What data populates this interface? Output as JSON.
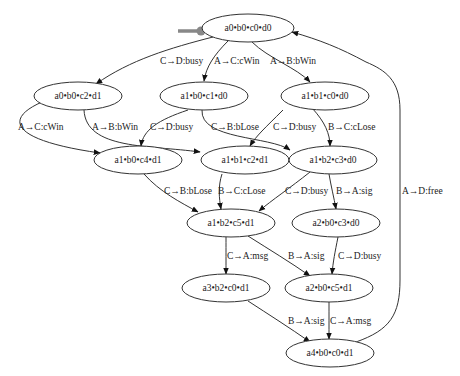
{
  "diagram": {
    "type": "state-transition-graph",
    "start_marker": {
      "color": "#888888",
      "points_to": "s0"
    },
    "nodes": [
      {
        "id": "s0",
        "label": "a0•b0•c0•d0",
        "cx": 248,
        "cy": 28
      },
      {
        "id": "s1",
        "label": "a0•b0•c2•d1",
        "cx": 78,
        "cy": 96
      },
      {
        "id": "s2",
        "label": "a1•b0•c1•d0",
        "cx": 204,
        "cy": 96
      },
      {
        "id": "s3",
        "label": "a1•b1•c0•d0",
        "cx": 325,
        "cy": 96
      },
      {
        "id": "s4",
        "label": "a1•b0•c4•d1",
        "cx": 138,
        "cy": 160
      },
      {
        "id": "s5",
        "label": "a1•b1•c2•d1",
        "cx": 245,
        "cy": 160
      },
      {
        "id": "s6",
        "label": "a1•b2•c3•d0",
        "cx": 333,
        "cy": 160
      },
      {
        "id": "s7",
        "label": "a1•b2•c5•d1",
        "cx": 231,
        "cy": 223
      },
      {
        "id": "s8",
        "label": "a2•b0•c3•d0",
        "cx": 336,
        "cy": 223
      },
      {
        "id": "s9",
        "label": "a3•b2•c0•d1",
        "cx": 226,
        "cy": 288
      },
      {
        "id": "s10",
        "label": "a2•b0•c5•d1",
        "cx": 329,
        "cy": 288
      },
      {
        "id": "s11",
        "label": "a4•b0•c0•d1",
        "cx": 330,
        "cy": 353
      }
    ],
    "edges": [
      {
        "from": "s0",
        "to": "s1",
        "label": "C→D:busy"
      },
      {
        "from": "s0",
        "to": "s2",
        "label": "A→C:cWin"
      },
      {
        "from": "s0",
        "to": "s3",
        "label": "A→B:bWin"
      },
      {
        "from": "s1",
        "to": "s4",
        "label": "A→C:cWin"
      },
      {
        "from": "s1",
        "to": "s5",
        "label": "A→B:bWin"
      },
      {
        "from": "s2",
        "to": "s4",
        "label": "C→D:busy"
      },
      {
        "from": "s2",
        "to": "s6",
        "label": "C→B:bLose"
      },
      {
        "from": "s3",
        "to": "s5",
        "label": "C→D:busy"
      },
      {
        "from": "s3",
        "to": "s6",
        "label": "B→C:cLose"
      },
      {
        "from": "s4",
        "to": "s7",
        "label": "C→B:bLose"
      },
      {
        "from": "s5",
        "to": "s7",
        "label": "B→C:cLose"
      },
      {
        "from": "s6",
        "to": "s7",
        "label": "C→D:busy"
      },
      {
        "from": "s6",
        "to": "s8",
        "label": "B→A:sig"
      },
      {
        "from": "s7",
        "to": "s9",
        "label": "C→A:msg"
      },
      {
        "from": "s7",
        "to": "s10",
        "label": "B→A:sig"
      },
      {
        "from": "s8",
        "to": "s10",
        "label": "C→D:busy"
      },
      {
        "from": "s9",
        "to": "s11",
        "label": "B→A:sig"
      },
      {
        "from": "s10",
        "to": "s11",
        "label": "C→A:msg"
      },
      {
        "from": "s11",
        "to": "s0",
        "label": "A→D:free"
      }
    ]
  }
}
